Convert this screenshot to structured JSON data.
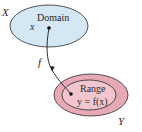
{
  "diagram": {
    "domain_set": {
      "set_label": "X",
      "region_label": "Domain",
      "element_label": "x",
      "fill_color": "#d3e7f5",
      "stroke_color": "#2b2b2b"
    },
    "codomain_set": {
      "set_label": "Y",
      "region_label": "Range",
      "element_label": "y = f(x)",
      "outer_fill_color": "#e8a9b6",
      "inner_fill_color": "#f3c6cf",
      "stroke_color": "#2b2b2b"
    },
    "mapping": {
      "label": "f",
      "from": "x",
      "to": "y = f(x)",
      "arrow_color": "#1a1a1a"
    }
  }
}
